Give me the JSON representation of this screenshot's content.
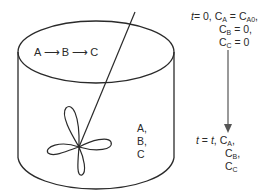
{
  "diagram": {
    "type": "batch-reactor-schematic",
    "reaction": {
      "species": [
        "A",
        "B",
        "C"
      ],
      "arrow": "⟶",
      "label": "A → B → C"
    },
    "contents_label": [
      "A,",
      "B,",
      "C"
    ],
    "initial_state": {
      "time_var": "t",
      "time_eq": "= 0,",
      "lines": [
        {
          "var": "C",
          "sub": "A",
          "rhs_main": " = C",
          "rhs_sub": "A0",
          "tail": ","
        },
        {
          "var": "C",
          "sub": "B",
          "rhs_main": " = 0,",
          "rhs_sub": "",
          "tail": ""
        },
        {
          "var": "C",
          "sub": "C",
          "rhs_main": " = 0",
          "rhs_sub": "",
          "tail": ""
        }
      ]
    },
    "final_state": {
      "time_var": "t",
      "time_eq_pre": " = ",
      "time_eq_var": "t",
      "time_eq_post": ",",
      "lines": [
        {
          "var": "C",
          "sub": "A",
          "tail": ","
        },
        {
          "var": "C",
          "sub": "B",
          "tail": ","
        },
        {
          "var": "C",
          "sub": "C",
          "tail": ""
        }
      ]
    },
    "colors": {
      "stroke": "#2a2a2a",
      "arrow": "#555555",
      "background": "#ffffff"
    }
  }
}
